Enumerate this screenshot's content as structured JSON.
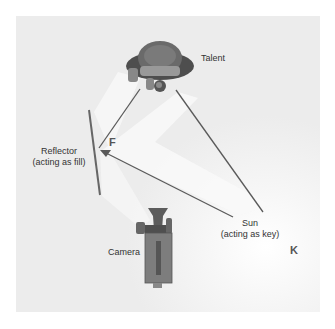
{
  "diagram": {
    "type": "lighting-setup",
    "labels": {
      "talent": "Talent",
      "reflector_line1": "Reflector",
      "reflector_line2": "(acting as fill)",
      "sun_line1": "Sun",
      "sun_line2": "(acting as key)",
      "camera": "Camera",
      "fill_marker": "F",
      "key_marker": "K"
    },
    "colors": {
      "background": "#ececec",
      "line": "#5a5a5a",
      "reflector": "#666666",
      "light_cone": "#f8f8f8",
      "figure_dark": "#555555",
      "camera_body": "#7d7d7d"
    }
  }
}
